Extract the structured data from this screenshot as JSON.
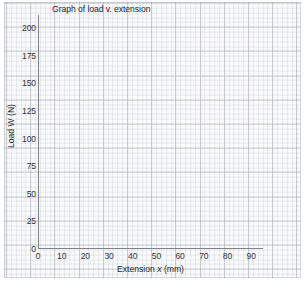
{
  "chart_data": {
    "type": "line",
    "title": "Graph of load v. extension",
    "xlabel_prefix": "Extension ",
    "xlabel_variable": "x",
    "xlabel_suffix": " (mm)",
    "xlabel": "Extension x (mm)",
    "ylabel": "Load W (N)",
    "xlim": [
      0,
      95
    ],
    "ylim": [
      0,
      212
    ],
    "xticks": [
      0,
      10,
      20,
      30,
      40,
      50,
      60,
      70,
      80,
      90
    ],
    "yticks": [
      0,
      25,
      50,
      75,
      100,
      125,
      150,
      175,
      200
    ],
    "xtick_labels": [
      "0",
      "10",
      "20",
      "30",
      "40",
      "50",
      "60",
      "70",
      "80",
      "90"
    ],
    "ytick_labels": [
      "0",
      "25",
      "50",
      "75",
      "100",
      "125",
      "150",
      "175",
      "200"
    ],
    "grid": true,
    "grid_style": "graph-paper",
    "grid_major_step_x": 10,
    "grid_major_step_y": 25,
    "grid_minor_divisions": 5,
    "legend": null,
    "series": [],
    "values": [],
    "categories": [],
    "annotations": [],
    "note": "Blank graph-paper axes; no data plotted"
  },
  "colors": {
    "axis_line": "#7d8189",
    "grid_major": "#969baa",
    "grid_minor": "#a5aab9",
    "paper_background": "#fafafa",
    "page_background": "#ffffff",
    "text": "#22262b"
  }
}
